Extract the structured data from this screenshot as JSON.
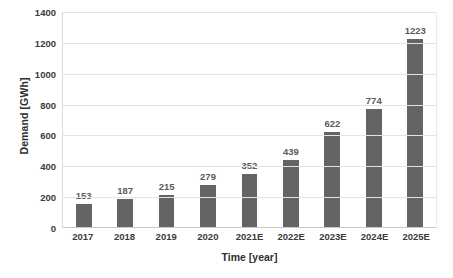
{
  "chart_data": {
    "type": "bar",
    "title": "",
    "xlabel": "Time [year]",
    "ylabel": "Demand [GWh]",
    "categories": [
      "2017",
      "2018",
      "2019",
      "2020",
      "2021E",
      "2022E",
      "2023E",
      "2024E",
      "2025E"
    ],
    "values": [
      153,
      187,
      215,
      279,
      352,
      439,
      622,
      774,
      1223
    ],
    "data_labels": [
      "153",
      "187",
      "215",
      "279",
      "352",
      "439",
      "622",
      "774",
      "1223"
    ],
    "ylim": [
      0,
      1400
    ],
    "ytick_step": 200,
    "yticks": [
      0,
      200,
      400,
      600,
      800,
      1000,
      1200,
      1400
    ],
    "ytick_labels": [
      "0",
      "200",
      "400",
      "600",
      "800",
      "1000",
      "1200",
      "1400"
    ],
    "grid": true,
    "grid_axis": "y",
    "legend": false,
    "legend_position": "none",
    "series": [
      {
        "name": "Demand",
        "values": [
          153,
          187,
          215,
          279,
          352,
          439,
          622,
          774,
          1223
        ]
      }
    ],
    "colors": {
      "bar": "#646464",
      "gridline": "#e3e3e3",
      "baseline": "#c9c9c9",
      "plot_border": "#d9d9d9",
      "tick_text": "#3b3b3b",
      "data_label_text": "#5b5b5b",
      "axis_title_text": "#2f2f2f",
      "background": "#ffffff"
    }
  }
}
